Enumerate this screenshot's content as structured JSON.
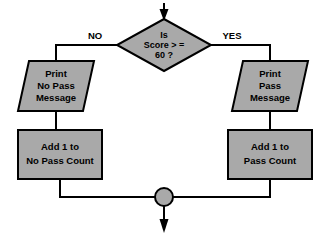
{
  "diagram": {
    "type": "flowchart",
    "colors": {
      "shape_fill": "#a9a9a9",
      "stroke": "#000000",
      "background": "#ffffff"
    },
    "entry_arrow": {
      "name": "entry-arrow",
      "direction": "down"
    },
    "decision": {
      "shape": "diamond",
      "line1": "Is",
      "line2": "Score > =",
      "line3": "60 ?"
    },
    "branch_labels": {
      "no": "NO",
      "yes": "YES"
    },
    "no_branch": {
      "output": {
        "shape": "parallelogram",
        "line1": "Print",
        "line2": "No Pass",
        "line3": "Message"
      },
      "process": {
        "shape": "rectangle",
        "line1": "Add 1 to",
        "line2": "No Pass Count"
      }
    },
    "yes_branch": {
      "output": {
        "shape": "parallelogram",
        "line1": "Print",
        "line2": "Pass",
        "line3": "Message"
      },
      "process": {
        "shape": "rectangle",
        "line1": "Add 1 to",
        "line2": "Pass Count"
      }
    },
    "merge": {
      "shape": "circle",
      "label": ""
    },
    "exit_arrow": {
      "name": "exit-arrow",
      "direction": "down"
    }
  }
}
